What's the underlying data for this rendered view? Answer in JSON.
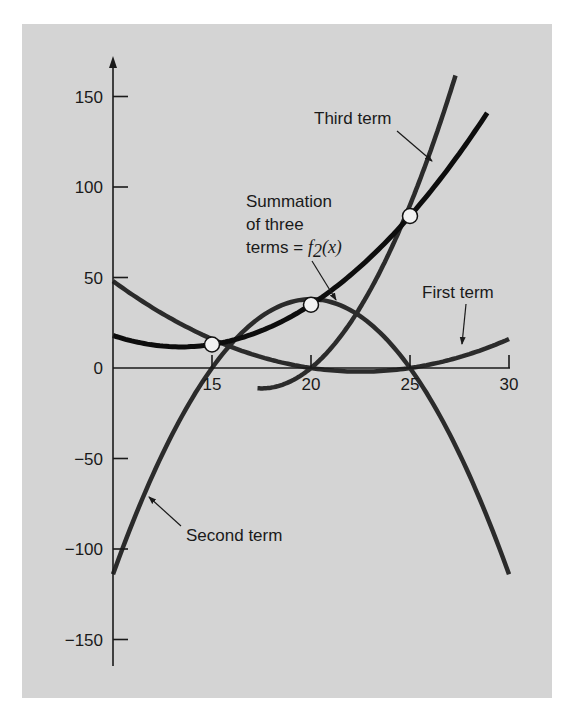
{
  "chart_data": {
    "type": "line",
    "title": "",
    "xlabel": "",
    "ylabel": "",
    "xlim": [
      10,
      30
    ],
    "ylim": [
      -160,
      170
    ],
    "x_ticks": [
      15,
      20,
      25,
      30
    ],
    "y_ticks": [
      150,
      100,
      50,
      0,
      -50,
      -100,
      -150
    ],
    "grid": false,
    "data_points": [
      {
        "x": 15,
        "y": 13
      },
      {
        "x": 20,
        "y": 35
      },
      {
        "x": 25,
        "y": 84
      }
    ],
    "series": [
      {
        "name": "First term",
        "formula": "16*(x-20)*(x-25)/50",
        "x": [
          10,
          15,
          20,
          25,
          30
        ],
        "values": [
          49,
          16,
          0,
          0,
          21
        ]
      },
      {
        "name": "Second term",
        "formula": "-38*(x-15)*(x-25)/25",
        "x": [
          10,
          15,
          20,
          25,
          30
        ],
        "values": [
          -114,
          0,
          38,
          0,
          -114
        ]
      },
      {
        "name": "Third term",
        "formula": "90*(x-15)*(x-20)/50",
        "x": [
          10,
          15,
          20,
          25,
          27.3
        ],
        "values": [
          90,
          0,
          0,
          90,
          171
        ]
      },
      {
        "name": "Summation of three terms = f2(x)",
        "x": [
          10,
          15,
          20,
          25,
          28.9
        ],
        "values": [
          25,
          13,
          35,
          84,
          136
        ]
      }
    ],
    "annotations": [
      {
        "text": "Third term",
        "target": "Third term"
      },
      {
        "text": "Summation of three terms = f2(x)",
        "target": "Summation"
      },
      {
        "text": "First term",
        "target": "First term"
      },
      {
        "text": "Second term",
        "target": "Second term"
      }
    ]
  },
  "labels": {
    "third_term": "Third term",
    "summation_line1": "Summation",
    "summation_line2": "of three",
    "summation_line3_prefix": "terms = ",
    "summation_func": "f",
    "summation_sub": "2",
    "summation_arg": "(x)",
    "first_term": "First term",
    "second_term": "Second term"
  },
  "axis": {
    "y_labels": [
      "150",
      "100",
      "50",
      "0",
      "−50",
      "−100",
      "−150"
    ],
    "x_labels": [
      "15",
      "20",
      "25",
      "30"
    ]
  },
  "colors": {
    "panel_bg": "#d4d4d4",
    "axis": "#1a1a1a",
    "curve_terms": "#2b2b2b",
    "curve_sum": "#0d0d0d",
    "marker_fill": "#f2f2f2"
  }
}
